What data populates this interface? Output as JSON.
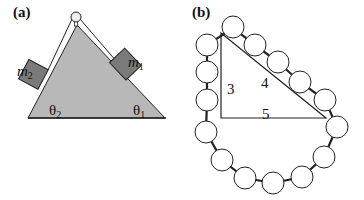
{
  "panel_a": {
    "label": "(a)",
    "mass1": {
      "symbol": "m",
      "subscript": "1"
    },
    "mass2": {
      "symbol": "m",
      "subscript": "2"
    },
    "angle1": {
      "symbol": "θ",
      "subscript": "1"
    },
    "angle2": {
      "symbol": "θ",
      "subscript": "2"
    },
    "colors": {
      "wedge": "#b8b8b8",
      "block": "#7a7a7a",
      "outline": "#222222"
    }
  },
  "panel_b": {
    "label": "(b)",
    "side_vertical": "3",
    "side_hypotenuse": "4",
    "side_base": "5",
    "bead_count": 15,
    "colors": {
      "bead_fill": "#ffffff",
      "outline": "#222222"
    }
  }
}
